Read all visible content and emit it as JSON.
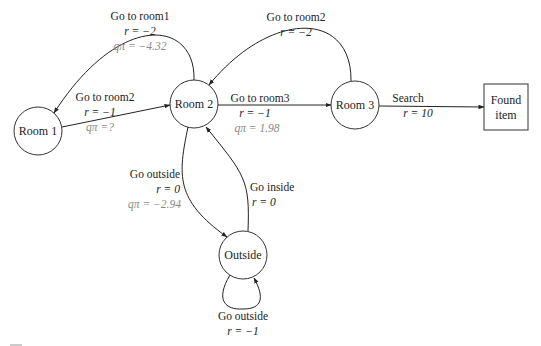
{
  "diagram": {
    "type": "state-transition-graph",
    "nodes": [
      {
        "id": "room1",
        "label": "Room 1",
        "shape": "circle"
      },
      {
        "id": "room2",
        "label": "Room 2",
        "shape": "circle"
      },
      {
        "id": "room3",
        "label": "Room 3",
        "shape": "circle"
      },
      {
        "id": "outside",
        "label": "Outside",
        "shape": "circle"
      },
      {
        "id": "found",
        "label_line1": "Found",
        "label_line2": "item",
        "shape": "rectangle"
      }
    ],
    "edges": {
      "room2_to_room1": {
        "action": "Go to room1",
        "reward": "r = −2",
        "q": "qπ = −4.32"
      },
      "room1_to_room2": {
        "action": "Go to room2",
        "reward": "r = −1",
        "q": "qπ =?"
      },
      "room3_to_room2": {
        "action": "Go to room2",
        "reward": "r = −2"
      },
      "room2_to_room3": {
        "action": "Go to room3",
        "reward": "r = −1",
        "q": "qπ = 1.98"
      },
      "room3_to_found": {
        "action": "Search",
        "reward": "r = 10"
      },
      "room2_to_outside": {
        "action": "Go outside",
        "reward": "r = 0",
        "q": "qπ = −2.94"
      },
      "outside_to_room2": {
        "action": "Go inside",
        "reward": "r = 0"
      },
      "outside_self": {
        "action": "Go outside",
        "reward": "r = −1"
      }
    },
    "colors": {
      "stroke": "#222222",
      "q_text": "#8a8a8a",
      "background": "#ffffff"
    }
  }
}
